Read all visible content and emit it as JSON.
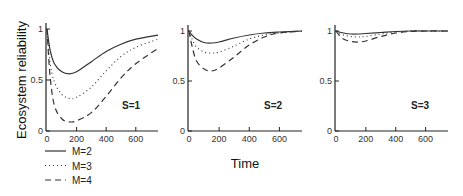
{
  "chart_data": [
    {
      "type": "line",
      "panel_label": "S=1",
      "ylabel": "Ecosystem reliability",
      "xlabel": "Time",
      "xlim": [
        0,
        750
      ],
      "ylim": [
        0,
        1
      ],
      "xticks": [
        0,
        200,
        400,
        600
      ],
      "yticks": [
        0,
        0.5,
        1
      ],
      "grid": false,
      "x": [
        0,
        20,
        50,
        100,
        150,
        200,
        300,
        400,
        500,
        600,
        750
      ],
      "series": [
        {
          "name": "M=2",
          "style": "solid",
          "values": [
            1.0,
            0.8,
            0.66,
            0.58,
            0.56,
            0.58,
            0.68,
            0.78,
            0.85,
            0.9,
            0.94
          ]
        },
        {
          "name": "M=3",
          "style": "dotted",
          "values": [
            1.0,
            0.68,
            0.48,
            0.36,
            0.32,
            0.33,
            0.43,
            0.59,
            0.73,
            0.82,
            0.9
          ]
        },
        {
          "name": "M=4",
          "style": "dashed",
          "values": [
            1.0,
            0.55,
            0.25,
            0.12,
            0.09,
            0.1,
            0.18,
            0.34,
            0.52,
            0.66,
            0.81
          ]
        }
      ]
    },
    {
      "type": "line",
      "panel_label": "S=2",
      "xlabel": "Time",
      "xlim": [
        0,
        750
      ],
      "ylim": [
        0,
        1
      ],
      "xticks": [
        0,
        200,
        400,
        600
      ],
      "yticks": [
        0,
        0.5,
        1
      ],
      "grid": false,
      "x": [
        0,
        20,
        50,
        100,
        150,
        200,
        300,
        400,
        500,
        600,
        750
      ],
      "series": [
        {
          "name": "M=2",
          "style": "solid",
          "values": [
            1.0,
            0.96,
            0.92,
            0.885,
            0.88,
            0.89,
            0.93,
            0.96,
            0.98,
            0.99,
            1.0
          ]
        },
        {
          "name": "M=3",
          "style": "dotted",
          "values": [
            1.0,
            0.92,
            0.84,
            0.79,
            0.78,
            0.79,
            0.85,
            0.92,
            0.96,
            0.98,
            1.0
          ]
        },
        {
          "name": "M=4",
          "style": "dashed",
          "values": [
            1.0,
            0.85,
            0.7,
            0.62,
            0.6,
            0.63,
            0.74,
            0.86,
            0.94,
            0.98,
            1.0
          ]
        }
      ]
    },
    {
      "type": "line",
      "panel_label": "S=3",
      "xlabel": "Time",
      "xlim": [
        0,
        750
      ],
      "ylim": [
        0,
        1
      ],
      "xticks": [
        0,
        200,
        400,
        600
      ],
      "yticks": [
        0,
        0.5,
        1
      ],
      "grid": false,
      "x": [
        0,
        20,
        50,
        100,
        150,
        200,
        300,
        400,
        500,
        600,
        750
      ],
      "series": [
        {
          "name": "M=2",
          "style": "solid",
          "values": [
            1.0,
            0.99,
            0.98,
            0.97,
            0.97,
            0.975,
            0.985,
            0.995,
            1.0,
            1.0,
            1.0
          ]
        },
        {
          "name": "M=3",
          "style": "dotted",
          "values": [
            1.0,
            0.98,
            0.96,
            0.945,
            0.94,
            0.945,
            0.97,
            0.99,
            1.0,
            1.0,
            1.0
          ]
        },
        {
          "name": "M=4",
          "style": "dashed",
          "values": [
            1.0,
            0.96,
            0.92,
            0.895,
            0.89,
            0.9,
            0.945,
            0.98,
            0.995,
            1.0,
            1.0
          ]
        }
      ]
    }
  ],
  "figure": {
    "ylabel": "Ecosystem reliability",
    "xlabel": "Time",
    "legend": [
      {
        "label": "M=2",
        "style": "solid"
      },
      {
        "label": "M=3",
        "style": "dotted"
      },
      {
        "label": "M=4",
        "style": "dashed"
      }
    ],
    "tick_labels": {
      "x": [
        "0",
        "200",
        "400",
        "600"
      ],
      "y": [
        "0",
        "0.5",
        "1"
      ]
    }
  }
}
